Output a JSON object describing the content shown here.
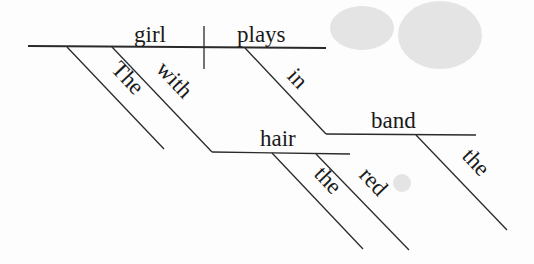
{
  "diagram": {
    "type": "reed-kellogg-sentence-diagram",
    "sentence": "The girl with red hair plays in the band",
    "subject": "girl",
    "verb": "plays",
    "words": {
      "subject": "girl",
      "verb": "plays",
      "subject_article": "The",
      "subject_prep": "with",
      "prep_object": "hair",
      "prep_object_article": "the",
      "prep_object_adj": "red",
      "verb_prep": "in",
      "verb_prep_object": "band",
      "verb_prep_object_article": "the"
    },
    "colors": {
      "line": "#2a2a2a",
      "text": "#1a1a1a",
      "background": "#fdfdfd"
    }
  }
}
